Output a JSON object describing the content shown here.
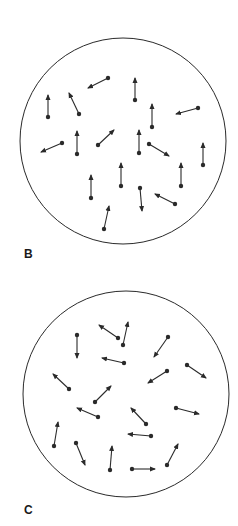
{
  "colors": {
    "stroke": "#2a2a2a",
    "background": "#ffffff"
  },
  "panels": [
    {
      "label": "B",
      "label_pos": [
        24,
        257
      ],
      "circle": {
        "cx": 123,
        "cy": 141,
        "r": 103
      },
      "description": "Dipoles mostly aligned upward",
      "arrows": [
        {
          "from": [
            108,
            78
          ],
          "to": [
            88,
            88
          ]
        },
        {
          "from": [
            135,
            100
          ],
          "to": [
            135,
            78
          ]
        },
        {
          "from": [
            48,
            117
          ],
          "to": [
            48,
            95
          ]
        },
        {
          "from": [
            79,
            114
          ],
          "to": [
            69,
            93
          ]
        },
        {
          "from": [
            152,
            127
          ],
          "to": [
            152,
            104
          ]
        },
        {
          "from": [
            198,
            108
          ],
          "to": [
            176,
            114
          ]
        },
        {
          "from": [
            62,
            143
          ],
          "to": [
            41,
            152
          ]
        },
        {
          "from": [
            77,
            154
          ],
          "to": [
            77,
            131
          ]
        },
        {
          "from": [
            98,
            145
          ],
          "to": [
            114,
            130
          ]
        },
        {
          "from": [
            139,
            153
          ],
          "to": [
            139,
            130
          ]
        },
        {
          "from": [
            149,
            144
          ],
          "to": [
            169,
            156
          ]
        },
        {
          "from": [
            203,
            165
          ],
          "to": [
            203,
            143
          ]
        },
        {
          "from": [
            121,
            186
          ],
          "to": [
            121,
            163
          ]
        },
        {
          "from": [
            181,
            186
          ],
          "to": [
            181,
            163
          ]
        },
        {
          "from": [
            91,
            198
          ],
          "to": [
            91,
            175
          ]
        },
        {
          "from": [
            140,
            188
          ],
          "to": [
            142,
            211
          ]
        },
        {
          "from": [
            175,
            204
          ],
          "to": [
            155,
            194
          ]
        },
        {
          "from": [
            104,
            229
          ],
          "to": [
            109,
            206
          ]
        }
      ]
    },
    {
      "label": "C",
      "label_pos": [
        24,
        513
      ],
      "circle": {
        "cx": 126,
        "cy": 394,
        "r": 103
      },
      "description": "Dipoles randomly oriented",
      "arrows": [
        {
          "from": [
            77,
            335
          ],
          "to": [
            77,
            358
          ]
        },
        {
          "from": [
            118,
            338
          ],
          "to": [
            99,
            325
          ]
        },
        {
          "from": [
            123,
            345
          ],
          "to": [
            128,
            322
          ]
        },
        {
          "from": [
            168,
            337
          ],
          "to": [
            154,
            357
          ]
        },
        {
          "from": [
            124,
            363
          ],
          "to": [
            102,
            358
          ]
        },
        {
          "from": [
            167,
            371
          ],
          "to": [
            148,
            383
          ]
        },
        {
          "from": [
            187,
            365
          ],
          "to": [
            206,
            378
          ]
        },
        {
          "from": [
            69,
            389
          ],
          "to": [
            53,
            374
          ]
        },
        {
          "from": [
            95,
            402
          ],
          "to": [
            111,
            386
          ]
        },
        {
          "from": [
            98,
            417
          ],
          "to": [
            77,
            408
          ]
        },
        {
          "from": [
            176,
            408
          ],
          "to": [
            199,
            414
          ]
        },
        {
          "from": [
            146,
            424
          ],
          "to": [
            131,
            408
          ]
        },
        {
          "from": [
            151,
            436
          ],
          "to": [
            128,
            434
          ]
        },
        {
          "from": [
            54,
            446
          ],
          "to": [
            58,
            422
          ]
        },
        {
          "from": [
            76,
            443
          ],
          "to": [
            85,
            465
          ]
        },
        {
          "from": [
            110,
            470
          ],
          "to": [
            112,
            446
          ]
        },
        {
          "from": [
            132,
            469
          ],
          "to": [
            155,
            469
          ]
        },
        {
          "from": [
            167,
            465
          ],
          "to": [
            178,
            444
          ]
        }
      ]
    }
  ]
}
